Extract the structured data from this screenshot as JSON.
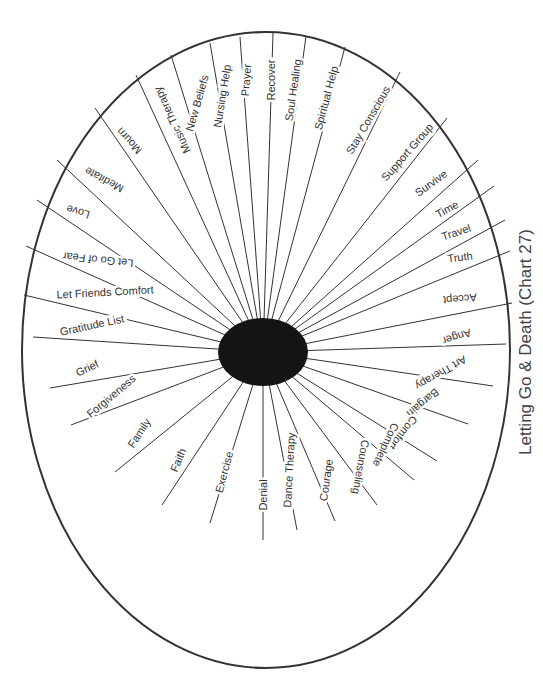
{
  "title": "Letting Go & Death (Chart 27)",
  "colors": {
    "line": "#333333",
    "hub": "#141414",
    "text": "#333333",
    "background": "#ffffff"
  },
  "chart_data": {
    "type": "radial-wheel",
    "title": "Letting Go & Death (Chart 27)",
    "center_hub": "solid black circle",
    "spoke_count": 43,
    "spokes": [
      "Recover",
      "Soul Healing",
      "Spiritual Help",
      "Stay Conscious",
      "Support Group",
      "Survive",
      "Time",
      "Travel",
      "Truth",
      "Accept",
      "Anger",
      "Art Therapy",
      "Bargain",
      "Comfort",
      "Complete",
      "Counseling",
      "Courage",
      "Dance Therapy",
      "Denial",
      "Exercise",
      "Faith",
      "Family",
      "Forgiveness",
      "Grief",
      "Gratitude List",
      "Let Friends Comfort",
      "Let Go of Fear",
      "Love",
      "Meditate",
      "Mourn",
      "Music Therapy",
      "New Beliefs",
      "Nursing Help",
      "Prayer"
    ]
  },
  "spokes": [
    {
      "label": "Recover",
      "ex": 273,
      "ey": 33,
      "lx": 271,
      "ly": 80,
      "rot": -90
    },
    {
      "label": "Soul Healing",
      "ex": 306,
      "ey": 36,
      "lx": 293,
      "ly": 90,
      "rot": -82
    },
    {
      "label": "Spiritual Help",
      "ex": 345,
      "ey": 47,
      "lx": 326,
      "ly": 98,
      "rot": -75
    },
    {
      "label": "Stay Conscious",
      "ex": 400,
      "ey": 72,
      "lx": 368,
      "ly": 120,
      "rot": -60
    },
    {
      "label": "Support Group",
      "ex": 447,
      "ey": 118,
      "lx": 407,
      "ly": 152,
      "rot": -49
    },
    {
      "label": "Survive",
      "ex": 478,
      "ey": 160,
      "lx": 431,
      "ly": 183,
      "rot": -36
    },
    {
      "label": "Time",
      "ex": 494,
      "ey": 186,
      "lx": 447,
      "ly": 209,
      "rot": -28
    },
    {
      "label": "Travel",
      "ex": 505,
      "ey": 220,
      "lx": 456,
      "ly": 232,
      "rot": -18
    },
    {
      "label": "Truth",
      "ex": 510,
      "ey": 251,
      "lx": 460,
      "ly": 257,
      "rot": -7
    },
    {
      "label": "Accept",
      "ex": 512,
      "ey": 303,
      "lx": 460,
      "ly": 299,
      "rot": 175
    },
    {
      "label": "Anger",
      "ex": 506,
      "ey": 344,
      "lx": 457,
      "ly": 337,
      "rot": 162
    },
    {
      "label": "Art Therapy",
      "ex": 493,
      "ey": 386,
      "lx": 441,
      "ly": 373,
      "rot": 150
    },
    {
      "label": "Bargain",
      "ex": 468,
      "ey": 424,
      "lx": 423,
      "ly": 403,
      "rot": 140
    },
    {
      "label": "Comfort",
      "ex": 437,
      "ey": 461,
      "lx": 403,
      "ly": 433,
      "rot": 128
    },
    {
      "label": "Complete",
      "ex": 414,
      "ey": 480,
      "lx": 386,
      "ly": 445,
      "rot": 115
    },
    {
      "label": "Counseling",
      "ex": 377,
      "ey": 505,
      "lx": 361,
      "ly": 467,
      "rot": 100
    },
    {
      "label": "Courage",
      "ex": 335,
      "ey": 521,
      "lx": 326,
      "ly": 480,
      "rot": -82
    },
    {
      "label": "Dance Therapy",
      "ex": 297,
      "ey": 530,
      "lx": 289,
      "ly": 470,
      "rot": -87
    },
    {
      "label": "Denial",
      "ex": 263,
      "ey": 540,
      "lx": 263,
      "ly": 495,
      "rot": -90
    },
    {
      "label": "Exercise",
      "ex": 210,
      "ey": 523,
      "lx": 224,
      "ly": 472,
      "rot": -75
    },
    {
      "label": "Faith",
      "ex": 162,
      "ey": 505,
      "lx": 178,
      "ly": 460,
      "rot": -67
    },
    {
      "label": "Family",
      "ex": 115,
      "ey": 472,
      "lx": 139,
      "ly": 433,
      "rot": -57
    },
    {
      "label": "Forgiveness",
      "ex": 71,
      "ey": 425,
      "lx": 111,
      "ly": 396,
      "rot": -40
    },
    {
      "label": "Grief",
      "ex": 50,
      "ey": 388,
      "lx": 87,
      "ly": 368,
      "rot": -25
    },
    {
      "label": "Gratitude List",
      "ex": 33,
      "ey": 337,
      "lx": 92,
      "ly": 325,
      "rot": -12
    },
    {
      "label": "Let Friends Comfort",
      "ex": 24,
      "ey": 295,
      "lx": 105,
      "ly": 292,
      "rot": -3
    },
    {
      "label": "Let Go of Fear",
      "ex": 26,
      "ey": 246,
      "lx": 98,
      "ly": 260,
      "rot": 186
    },
    {
      "label": "Love",
      "ex": 37,
      "ey": 200,
      "lx": 78,
      "ly": 212,
      "rot": 196
    },
    {
      "label": "Meditate",
      "ex": 57,
      "ey": 160,
      "lx": 104,
      "ly": 180,
      "rot": 208
    },
    {
      "label": "Mourn",
      "ex": 95,
      "ey": 108,
      "lx": 129,
      "ly": 141,
      "rot": 227
    },
    {
      "label": "Music Therapy",
      "ex": 136,
      "ey": 75,
      "lx": 172,
      "ly": 120,
      "rot": 245
    },
    {
      "label": "New Beliefs",
      "ex": 171,
      "ey": 55,
      "lx": 197,
      "ly": 103,
      "rot": -74
    },
    {
      "label": "Nursing Help",
      "ex": 210,
      "ey": 43,
      "lx": 222,
      "ly": 96,
      "rot": -81
    },
    {
      "label": "Prayer",
      "ex": 240,
      "ey": 37,
      "lx": 246,
      "ly": 80,
      "rot": -86
    }
  ]
}
